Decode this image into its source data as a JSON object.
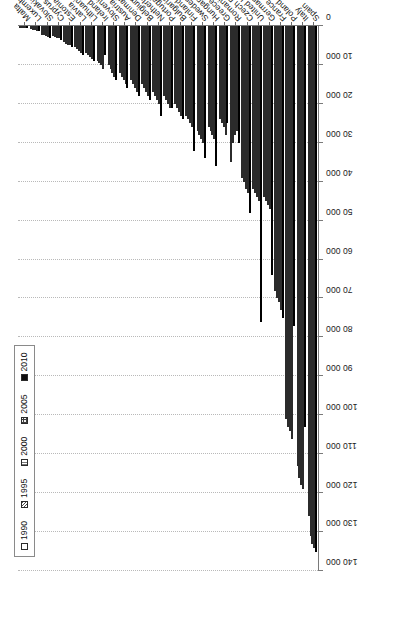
{
  "chart_data": {
    "type": "bar",
    "orientation": "horizontal-rotated",
    "title": "",
    "subtitle": "",
    "xlabel": "",
    "ylabel": "",
    "grid": true,
    "legend_position": "top-left",
    "value_axis": {
      "min": 0,
      "max": 140000,
      "step": 10000,
      "ticks": [
        0,
        10000,
        20000,
        30000,
        40000,
        50000,
        60000,
        70000,
        80000,
        90000,
        100000,
        110000,
        120000,
        130000,
        140000
      ],
      "tick_labels": [
        "0",
        "10 000",
        "20 000",
        "30 000",
        "40 000",
        "50 000",
        "60 000",
        "70 000",
        "80 000",
        "90 000",
        "100 000",
        "110 000",
        "120 000",
        "130 000",
        "140 000"
      ]
    },
    "categories": [
      "Spain",
      "Italy",
      "Poland",
      "France",
      "Germany",
      "United Kingdom",
      "Czech Republic",
      "Romania",
      "Greece",
      "Hungary",
      "Sweden",
      "Finland",
      "Bulgaria",
      "Portugal",
      "Netherlands",
      "Belgium",
      "Denmark",
      "Austria",
      "Slovenia",
      "Ireland",
      "Lithuania",
      "Latvia",
      "Estonia",
      "Cyprus",
      "Slovakia",
      "Luxembourg",
      "Malta"
    ],
    "series": [
      {
        "name": "1990",
        "pattern": "open",
        "values": [
          126000,
          113000,
          101000,
          68000,
          44000,
          42000,
          39000,
          35000,
          24000,
          26000,
          27000,
          23000,
          20000,
          18000,
          17000,
          15000,
          14000,
          12000,
          10000,
          9000,
          7000,
          5500,
          4200,
          2600,
          2200,
          900,
          300
        ]
      },
      {
        "name": "1995",
        "pattern": "diagonal-hatch",
        "values": [
          131000,
          116000,
          103000,
          70000,
          45000,
          43000,
          40000,
          30000,
          25000,
          27000,
          28000,
          24000,
          21000,
          19000,
          18000,
          16000,
          15000,
          13000,
          11000,
          9500,
          7500,
          6000,
          4500,
          2800,
          2400,
          1000,
          320
        ]
      },
      {
        "name": "2000",
        "pattern": "light-dotted",
        "values": [
          133000,
          118000,
          104000,
          71000,
          46000,
          44000,
          42000,
          28000,
          26000,
          28000,
          29000,
          25000,
          22000,
          20000,
          19000,
          17000,
          16000,
          14000,
          12000,
          10000,
          8000,
          6500,
          4800,
          3000,
          2600,
          1100,
          340
        ]
      },
      {
        "name": "2005",
        "pattern": "cross-dotted",
        "values": [
          134000,
          119000,
          106000,
          73000,
          47000,
          45000,
          43000,
          27000,
          28000,
          29000,
          30000,
          26000,
          23000,
          21000,
          20000,
          18000,
          17000,
          15000,
          13000,
          11000,
          8500,
          7000,
          5000,
          3200,
          2800,
          1200,
          360
        ]
      },
      {
        "name": "2010",
        "pattern": "solid-black",
        "values": [
          135000,
          103000,
          77000,
          75000,
          64000,
          76000,
          48000,
          30000,
          25000,
          36000,
          34000,
          32000,
          24000,
          21000,
          23000,
          19000,
          18000,
          16000,
          14000,
          7500,
          9000,
          7500,
          5500,
          3500,
          3000,
          1300,
          400
        ]
      }
    ]
  },
  "legend": {
    "items": [
      {
        "label": "1990",
        "swatch": "open-square-icon"
      },
      {
        "label": "1995",
        "swatch": "hatched-square-icon"
      },
      {
        "label": "2000",
        "swatch": "dotted-square-icon"
      },
      {
        "label": "2005",
        "swatch": "checkered-square-icon"
      },
      {
        "label": "2010",
        "swatch": "filled-square-icon"
      }
    ]
  }
}
